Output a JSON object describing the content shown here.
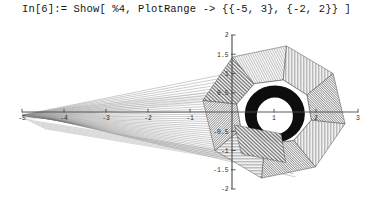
{
  "notebook": {
    "prompt": "In[6]:=",
    "expression": "Show[ %4, PlotRange -> {{-5, 3}, {-2, 2}} ]",
    "input_line": "In[6]:= Show[ %4, PlotRange -> {{-5, 3}, {-2, 2}} ]"
  },
  "chart_data": {
    "type": "line",
    "title": "",
    "subtitle": "",
    "xlabel": "",
    "ylabel": "",
    "xlim": [
      -5,
      3
    ],
    "ylim": [
      -2,
      2
    ],
    "grid": false,
    "legend": "none",
    "axes_style": "cross-hair axes through origin, ticks on both sides",
    "xticks": [
      -5,
      -4,
      -3,
      -2,
      -1,
      1,
      2,
      3
    ],
    "xtick_labels": [
      "-5",
      "-4",
      "-3",
      "-2",
      "-1",
      "1",
      "2",
      "3"
    ],
    "yticks": [
      2,
      1.5,
      1,
      0.5,
      -0.5,
      -1,
      -1.5,
      -2
    ],
    "ytick_labels": [
      "2",
      "1.5",
      "1",
      "0.5",
      "-0.5",
      "-1",
      "-1.5",
      "-2"
    ],
    "annotations": [],
    "series": [
      {
        "name": "torus-outer-octagon",
        "kind": "polygon",
        "center": [
          1.0,
          0.0
        ],
        "outer_radius": 1.72,
        "sides": 8,
        "rotation_deg": 10,
        "values": []
      },
      {
        "name": "torus-inner-octagon",
        "kind": "polygon",
        "center": [
          1.0,
          0.0
        ],
        "outer_radius": 0.95,
        "sides": 8,
        "rotation_deg": 14,
        "values": []
      },
      {
        "name": "dark-inner-ring",
        "kind": "annulus",
        "center": [
          1.02,
          -0.05
        ],
        "outer_radius": 0.78,
        "inner_radius": 0.46,
        "values": []
      },
      {
        "name": "left-mesh-fan",
        "kind": "line-fan",
        "apex": [
          -5.0,
          -0.12
        ],
        "spread_x": 0.45,
        "count": 34,
        "values": []
      }
    ]
  },
  "colors": {
    "background": "#ffffff",
    "axis": "#4a4a4a",
    "mesh": "#3a3a3a",
    "fill_light": "#d9d9d9",
    "fill_dark": "#101010",
    "text": "#151515"
  }
}
